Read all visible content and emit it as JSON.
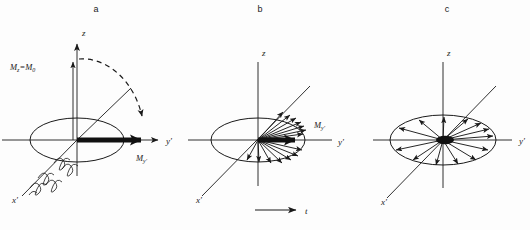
{
  "figure": {
    "title_visible": false,
    "background_color": "#fdfdfd",
    "ink_color": "#1a1a1a",
    "panels": [
      {
        "letter": "a",
        "letter_x": 96,
        "letter_y": 12,
        "origin_x": 77,
        "origin_y": 140,
        "axes": [
          {
            "name": "z",
            "label": "z",
            "label_x": 82,
            "label_y": 36
          },
          {
            "name": "y-prime",
            "label": "y",
            "prime": "'",
            "label_x": 166,
            "label_y": 141
          },
          {
            "name": "x-prime",
            "label": "x",
            "prime": "'",
            "label_x": 12,
            "label_y": 203
          }
        ],
        "vector_labels": [
          {
            "name": "mz-equals-m0",
            "main": "M",
            "sub": "z",
            "tail": "=M",
            "tail_sub": "0",
            "x": 12,
            "y": 70
          },
          {
            "name": "my-prime",
            "main": "M",
            "sub": "y'",
            "x": 136,
            "y": 160
          }
        ],
        "features": [
          "z-axis-arrow",
          "y-prime-axis-arrow",
          "transverse-ellipse",
          "dashed-rotation-arc",
          "thick-magnetization-vector",
          "rf-coil-helix-on-x-prime"
        ]
      },
      {
        "letter": "b",
        "letter_x": 260,
        "letter_y": 12,
        "origin_x": 258,
        "origin_y": 140,
        "axes": [
          {
            "name": "z",
            "label": "z",
            "label_x": 262,
            "label_y": 56
          },
          {
            "name": "y-prime",
            "label": "y",
            "prime": "'",
            "label_x": 338,
            "label_y": 145
          },
          {
            "name": "x-prime",
            "label": "x",
            "prime": "'",
            "label_x": 196,
            "label_y": 203
          }
        ],
        "vector_labels": [
          {
            "name": "my-prime",
            "main": "M",
            "sub": "y'",
            "x": 316,
            "y": 128
          }
        ],
        "features": [
          "transverse-ellipse",
          "fan-of-dephasing-vectors",
          "thick-resultant-vector"
        ]
      },
      {
        "letter": "c",
        "letter_x": 447,
        "letter_y": 12,
        "origin_x": 443,
        "origin_y": 140,
        "axes": [
          {
            "name": "z",
            "label": "z",
            "label_x": 447,
            "label_y": 56
          },
          {
            "name": "y-prime",
            "label": "y",
            "prime": "'",
            "label_x": 519,
            "label_y": 143
          },
          {
            "name": "x-prime",
            "label": "x",
            "prime": "'",
            "label_x": 381,
            "label_y": 205
          }
        ],
        "vector_labels": [],
        "features": [
          "transverse-ellipse",
          "fully-dephased-radial-vectors"
        ]
      }
    ],
    "time_arrow": {
      "name": "time-axis-arrow",
      "label": "t",
      "label_x": 306,
      "label_y": 214,
      "line_x1": 255,
      "line_x2": 298,
      "line_y": 210
    }
  }
}
